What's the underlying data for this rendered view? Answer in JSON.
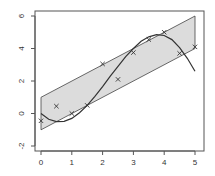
{
  "chart_data": {
    "type": "scatter",
    "title": "",
    "xlabel": "",
    "ylabel": "",
    "xlim": [
      0,
      5
    ],
    "ylim": [
      -2,
      6
    ],
    "x_ticks": [
      0,
      1,
      2,
      3,
      4,
      5
    ],
    "y_ticks": [
      -2,
      0,
      2,
      4,
      6
    ],
    "x_tick_labels": [
      "0",
      "1",
      "2",
      "3",
      "4",
      "5"
    ],
    "y_tick_labels": [
      "-2",
      "0",
      "2",
      "4",
      "6"
    ],
    "grid": false,
    "legend": null,
    "band": {
      "name": "prediction band",
      "fill": "#dcdcdc",
      "lower": [
        [
          0,
          -1
        ],
        [
          5,
          4
        ]
      ],
      "upper": [
        [
          0,
          1
        ],
        [
          5,
          6
        ]
      ]
    },
    "series": [
      {
        "name": "observations",
        "type": "scatter",
        "marker": "x",
        "x": [
          0,
          0.5,
          1,
          1.5,
          2,
          2.5,
          3,
          3.5,
          4,
          4.5,
          5
        ],
        "y": [
          -0.45,
          0.45,
          0.0,
          0.5,
          3.05,
          2.1,
          3.75,
          4.55,
          5.0,
          3.7,
          4.1
        ]
      },
      {
        "name": "fitted curve",
        "type": "line",
        "x": [
          0,
          0.25,
          0.5,
          0.75,
          1,
          1.25,
          1.5,
          1.75,
          2,
          2.25,
          2.5,
          2.75,
          3,
          3.25,
          3.5,
          3.75,
          4,
          4.25,
          4.5,
          4.75,
          5
        ],
        "y": [
          0.0,
          -0.35,
          -0.5,
          -0.48,
          -0.3,
          0.05,
          0.5,
          1.05,
          1.65,
          2.3,
          2.9,
          3.5,
          4.0,
          4.45,
          4.72,
          4.85,
          4.8,
          4.55,
          4.05,
          3.4,
          2.6
        ]
      }
    ]
  }
}
